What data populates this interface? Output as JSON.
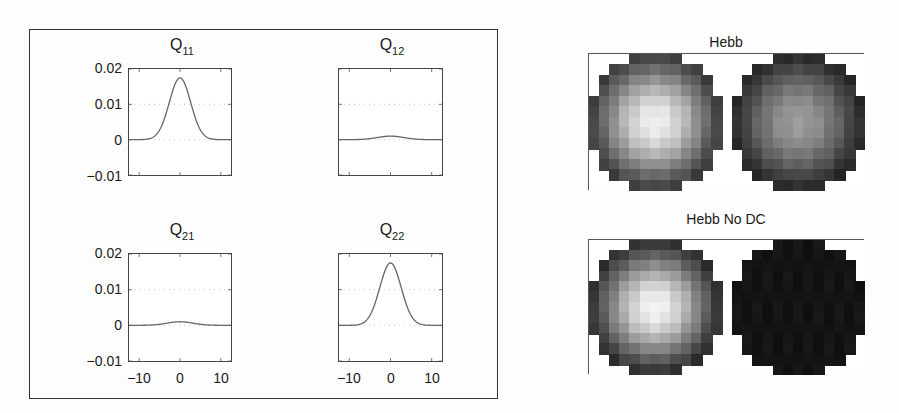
{
  "chart_data": [
    {
      "type": "line",
      "title": "Q11",
      "title_main": "Q",
      "title_sub": "11",
      "xlabel": "",
      "ylabel": "",
      "xlim": [
        -12.5,
        12.5
      ],
      "ylim": [
        -0.01,
        0.02
      ],
      "yticks": [
        "0.02",
        "0.01",
        "0",
        "-0.01"
      ],
      "xticks": [],
      "grid": "dotted",
      "series": [
        {
          "name": "Q11",
          "shape": "gaussian",
          "peak_x": 0,
          "peak_y": 0.0175,
          "sigma": 2.6,
          "baseline": 0
        }
      ]
    },
    {
      "type": "line",
      "title": "Q12",
      "title_main": "Q",
      "title_sub": "12",
      "xlim": [
        -12.5,
        12.5
      ],
      "ylim": [
        -0.01,
        0.02
      ],
      "yticks": [],
      "xticks": [],
      "grid": "dotted",
      "series": [
        {
          "name": "Q12",
          "shape": "gaussian",
          "peak_x": 0,
          "peak_y": 0.001,
          "sigma": 3.2,
          "baseline": 0
        }
      ]
    },
    {
      "type": "line",
      "title": "Q21",
      "title_main": "Q",
      "title_sub": "21",
      "xlim": [
        -12.5,
        12.5
      ],
      "ylim": [
        -0.01,
        0.02
      ],
      "yticks": [
        "0.02",
        "0.01",
        "0",
        "-0.01"
      ],
      "xticks": [
        "-10",
        "0",
        "10"
      ],
      "grid": "dotted",
      "series": [
        {
          "name": "Q21",
          "shape": "gaussian",
          "peak_x": 0,
          "peak_y": 0.001,
          "sigma": 3.2,
          "baseline": 0
        }
      ]
    },
    {
      "type": "line",
      "title": "Q22",
      "title_main": "Q",
      "title_sub": "22",
      "xlim": [
        -12.5,
        12.5
      ],
      "ylim": [
        -0.01,
        0.02
      ],
      "yticks": [],
      "xticks": [
        "-10",
        "0",
        "10"
      ],
      "grid": "dotted",
      "series": [
        {
          "name": "Q22",
          "shape": "gaussian",
          "peak_x": 0,
          "peak_y": 0.0175,
          "sigma": 2.6,
          "baseline": 0
        }
      ]
    },
    {
      "type": "heatmap",
      "title": "Hebb",
      "grid_size": [
        13,
        13
      ],
      "panels": [
        "left receptive field (bright center, peak near center)",
        "right receptive field (mid-gray, flatter profile)"
      ],
      "left": {
        "center": 0.98,
        "edge": 0.22,
        "sigma": 4.2
      },
      "right": {
        "center": 0.62,
        "edge": 0.12,
        "sigma": 5.0
      }
    },
    {
      "type": "heatmap",
      "title": "Hebb No DC",
      "grid_size": [
        13,
        13
      ],
      "panels": [
        "left receptive field (bright center)",
        "right receptive field (uniformly near-black)"
      ],
      "left": {
        "center": 1.0,
        "edge": 0.16,
        "sigma": 4.0
      },
      "right": {
        "center": 0.04,
        "edge": 0.04,
        "sigma": 5.0
      }
    }
  ],
  "labels": {
    "q11": {
      "main": "Q",
      "sub": "11"
    },
    "q12": {
      "main": "Q",
      "sub": "12"
    },
    "q21": {
      "main": "Q",
      "sub": "21"
    },
    "q22": {
      "main": "Q",
      "sub": "22"
    },
    "yticks": [
      "0.02",
      "0.01",
      "0",
      "−0.01"
    ],
    "xticks": [
      "−10",
      "0",
      "10"
    ],
    "hebb": "Hebb",
    "hebb_no_dc": "Hebb No DC"
  }
}
